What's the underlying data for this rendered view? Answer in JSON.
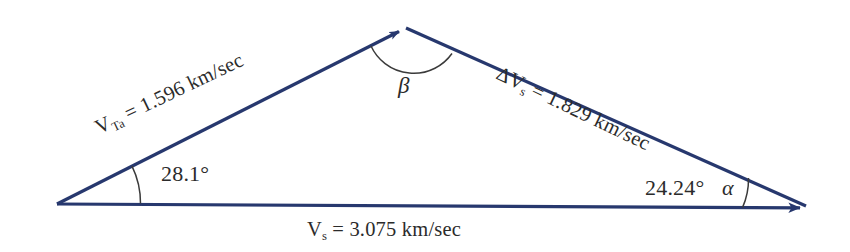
{
  "diagram": {
    "background_color": "#ffffff",
    "vector_color": "#27386e",
    "arc_color": "#3b3b3b",
    "text_color": "#2b2b2b"
  },
  "vectors": {
    "v_ta": {
      "symbol": "V",
      "subscript": "Ta",
      "equals": " = ",
      "value": "1.596",
      "units": " km/sec",
      "full_label": "V_Ta = 1.596 km/sec",
      "magnitude_km_s": 1.596,
      "has_arrowhead": true
    },
    "delta_v_s": {
      "symbol": "ΔV",
      "subscript": "s",
      "equals": " = ",
      "value": "1.829",
      "units": " km/sec",
      "full_label": "ΔV_s = 1.829 km/sec",
      "magnitude_km_s": 1.829,
      "has_arrowhead": false
    },
    "v_s": {
      "symbol": "V",
      "subscript": "s",
      "equals": " = ",
      "value": "3.075",
      "units": " km/sec",
      "full_label": "V_s = 3.075 km/sec",
      "magnitude_km_s": 3.075,
      "has_arrowhead": true
    }
  },
  "angles": {
    "left": {
      "label": "28.1°",
      "value_deg": 28.1,
      "vertex": "left"
    },
    "right": {
      "label": "24.24°",
      "value_deg": 24.24,
      "greek": "α",
      "vertex": "right"
    },
    "apex": {
      "greek": "β",
      "label": "β",
      "vertex": "apex"
    }
  },
  "geometry": {
    "left_vertex": {
      "x": 57,
      "y": 204
    },
    "apex_vertex": {
      "x": 406,
      "y": 28
    },
    "right_vertex": {
      "x": 812,
      "y": 208
    }
  }
}
